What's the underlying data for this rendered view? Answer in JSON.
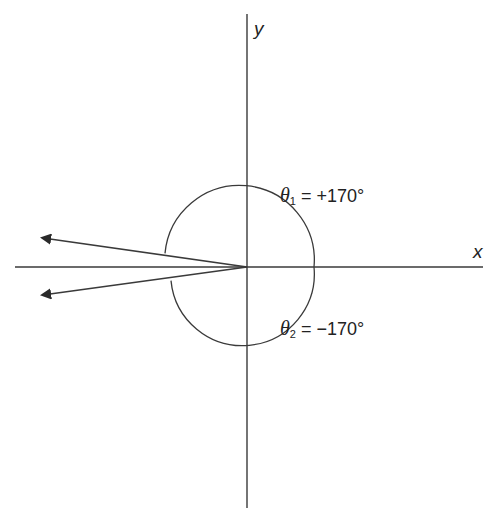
{
  "diagram": {
    "axes": {
      "x_label": "x",
      "y_label": "y"
    },
    "angles": [
      {
        "symbol": "θ",
        "subscript": "1",
        "value_text": " = +170°",
        "degrees": 170
      },
      {
        "symbol": "θ",
        "subscript": "2",
        "value_text": " = −170°",
        "degrees": -170
      }
    ],
    "colors": {
      "line": "#3a3a3a",
      "text": "#222222",
      "background": "#ffffff"
    }
  }
}
